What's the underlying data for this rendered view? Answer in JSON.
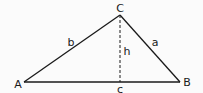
{
  "diagram": {
    "vertices": [
      {
        "label": "A",
        "x": 24,
        "y": 82
      },
      {
        "label": "B",
        "x": 180,
        "y": 82
      },
      {
        "label": "C",
        "x": 120,
        "y": 15
      }
    ],
    "sides": [
      {
        "label": "b",
        "from": "A",
        "to": "C"
      },
      {
        "label": "a",
        "from": "C",
        "to": "B"
      },
      {
        "label": "c",
        "from": "A",
        "to": "B"
      }
    ],
    "altitude": {
      "label": "h",
      "from": "C",
      "style": "dashed"
    },
    "colors": {
      "stroke": "#1a1a1a",
      "background": "#fbfbfb"
    }
  }
}
